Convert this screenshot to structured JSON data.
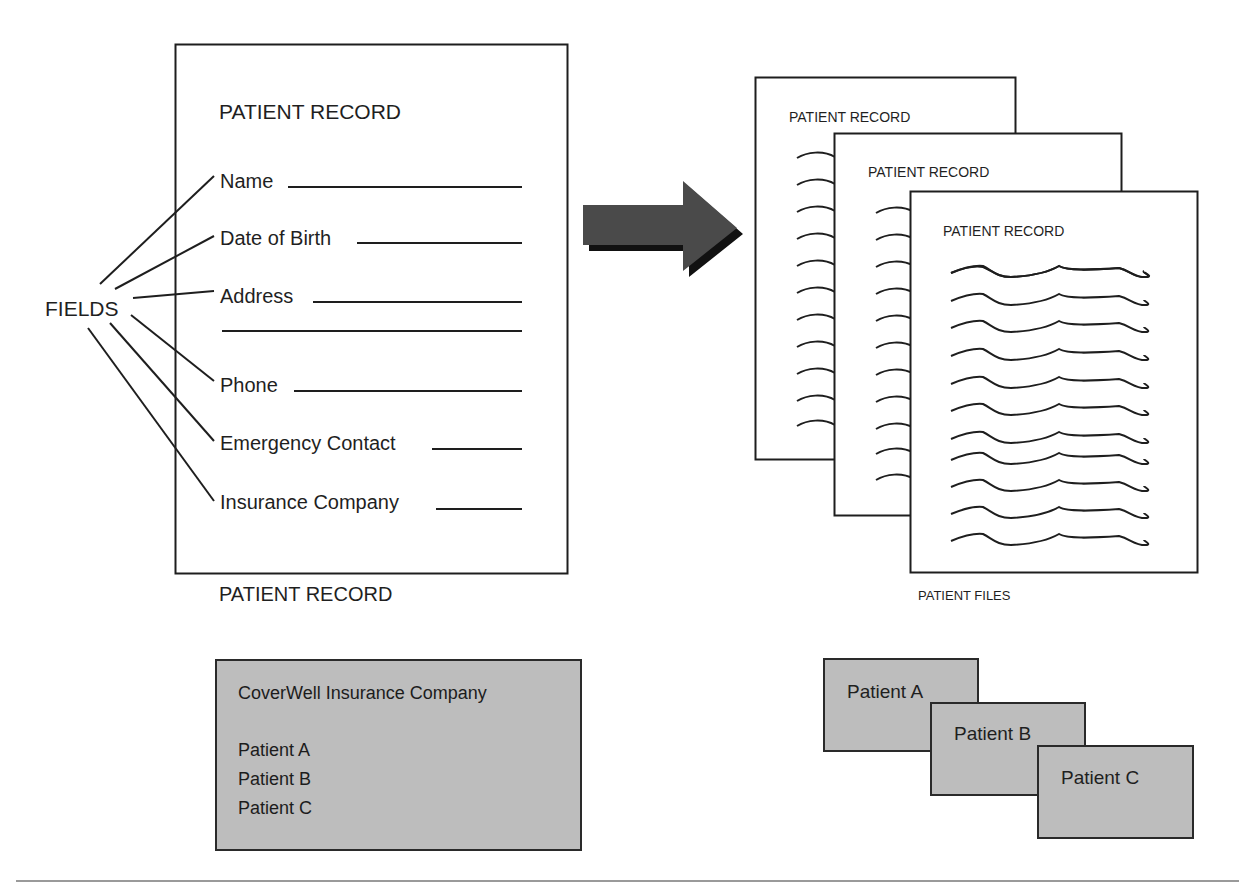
{
  "colors": {
    "ink": "#1e1e1e",
    "arrow_fill": "#4a4a4a",
    "arrow_shadow": "#111111",
    "box_fill": "#bdbdbd",
    "rule": "#9a9a9a"
  },
  "fields_label": "FIELDS",
  "form": {
    "title": "PATIENT RECORD",
    "caption": "PATIENT RECORD",
    "fields": [
      {
        "label": "Name"
      },
      {
        "label": "Date of Birth"
      },
      {
        "label": "Address"
      },
      {
        "label": "Phone"
      },
      {
        "label": "Emergency Contact"
      },
      {
        "label": "Insurance Company"
      }
    ]
  },
  "arrow": {
    "icon": "right-arrow-icon",
    "direction": "right"
  },
  "files": {
    "sheets": [
      {
        "title": "PATIENT RECORD"
      },
      {
        "title": "PATIENT RECORD"
      },
      {
        "title": "PATIENT RECORD"
      }
    ],
    "caption": "PATIENT FILES"
  },
  "insurance_box": {
    "company": "CoverWell Insurance Company",
    "patients": [
      "Patient A",
      "Patient B",
      "Patient C"
    ]
  },
  "patient_cards": [
    "Patient A",
    "Patient B",
    "Patient C"
  ]
}
